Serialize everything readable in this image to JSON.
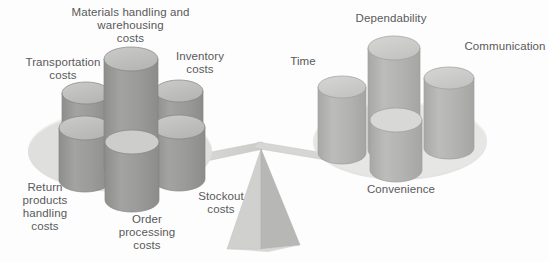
{
  "diagram": {
    "type": "balance-scale",
    "colors": {
      "background": "#fdfdfd",
      "platform": "#dcdcda",
      "platform_right": "#e2e2e0",
      "cylinder_top": "#c2c2c0",
      "cylinder_top_right": "#cdcdcb",
      "cylinder_body": "#9b9b99",
      "cylinder_body_right": "#b3b3b1",
      "cylinder_outline": "#8a8a88",
      "beam": "#d3d3d1",
      "fulcrum_light": "#d9d9d7",
      "fulcrum_dark": "#b9b9b7",
      "text": "#59595b"
    }
  },
  "left_pan": {
    "name": "logistics-costs",
    "labels": [
      {
        "id": "transportation",
        "text": "Transportation\ncosts",
        "x": 8,
        "y": 56,
        "width": 110
      },
      {
        "id": "materials-handling",
        "text": "Materials handling and\nwarehousing\ncosts",
        "x": 63,
        "y": 6,
        "width": 135
      },
      {
        "id": "inventory",
        "text": "Inventory\ncosts",
        "x": 164,
        "y": 50,
        "width": 72
      },
      {
        "id": "return-products",
        "text": "Return\nproducts\nhandling\ncosts",
        "x": 10,
        "y": 181,
        "width": 70
      },
      {
        "id": "order-processing",
        "text": "Order\nprocessing\ncosts",
        "x": 107,
        "y": 213,
        "width": 80
      },
      {
        "id": "stockout",
        "text": "Stockout\ncosts",
        "x": 186,
        "y": 190,
        "width": 70
      }
    ],
    "cylinder_count": 5
  },
  "right_pan": {
    "name": "customer-service-elements",
    "labels": [
      {
        "id": "time",
        "text": "Time",
        "x": 283,
        "y": 55,
        "width": 40
      },
      {
        "id": "dependability",
        "text": "Dependability",
        "x": 345,
        "y": 12,
        "width": 92
      },
      {
        "id": "communication",
        "text": "Communication",
        "x": 461,
        "y": 40,
        "width": 88
      },
      {
        "id": "convenience",
        "text": "Convenience",
        "x": 357,
        "y": 183,
        "width": 88
      }
    ],
    "cylinder_count": 4
  },
  "fulcrum": {
    "name": "pyramid-fulcrum",
    "label": ""
  }
}
